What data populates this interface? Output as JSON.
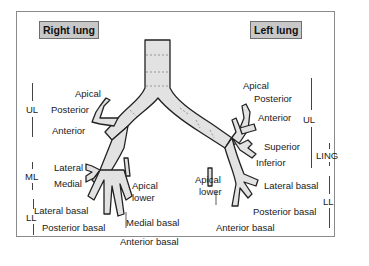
{
  "titles": {
    "right": "Right lung",
    "left": "Left lung"
  },
  "colors": {
    "airway_fill": "#e2e2e2",
    "airway_outline": "#222222",
    "title_box": "#c8c8c8",
    "frame": "#8a8a8a"
  },
  "right": {
    "lobes": {
      "ul": "UL",
      "ml": "ML",
      "ll": "LL"
    },
    "segments": {
      "apical": "Apical",
      "posterior": "Posterior",
      "anterior": "Anterior",
      "lateral": "Lateral",
      "medial": "Medial",
      "apical_lower_1": "Apical",
      "apical_lower_2": "lower",
      "lateral_basal": "Lateral basal",
      "posterior_basal": "Posterior basal",
      "medial_basal": "Medial basal",
      "anterior_basal": "Anterior basal"
    }
  },
  "left": {
    "lobes": {
      "ul": "UL",
      "ling": "LING",
      "ll": "LL"
    },
    "segments": {
      "apical": "Apical",
      "posterior": "Posterior",
      "anterior": "Anterior",
      "superior": "Superior",
      "inferior": "Inferior",
      "apical_lower_1": "Apical",
      "apical_lower_2": "lower",
      "lateral_basal": "Lateral basal",
      "posterior_basal": "Posterior basal",
      "anterior_basal": "Anterior basal"
    }
  }
}
